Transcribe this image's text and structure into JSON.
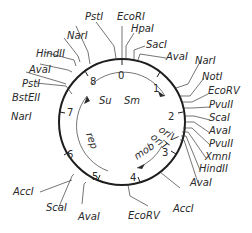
{
  "diagram": {
    "type": "plasmid-map",
    "scale_ticks": [
      "0",
      "1",
      "2",
      "3",
      "4",
      "5",
      "6",
      "7",
      "8"
    ],
    "genes": [
      {
        "label": "Su",
        "direction": "clockwise"
      },
      {
        "label": "Sm",
        "direction": "clockwise"
      },
      {
        "label": "rep",
        "direction": "clockwise"
      },
      {
        "label": "mob",
        "direction": "counterclockwise"
      },
      {
        "label": "oriV"
      },
      {
        "label": "oriT"
      }
    ],
    "restriction_sites": {
      "top": [
        "PstI",
        "EcoRI",
        "HpaI",
        "SacI",
        "AvaI"
      ],
      "right": [
        "NarI",
        "NotI",
        "EcoRV",
        "PvuII",
        "ScaI",
        "AvaI",
        "PvuII",
        "XmnI",
        "HindII",
        "AvaI"
      ],
      "bottom": [
        "AccI",
        "EcoRV",
        "AvaI",
        "ScaI",
        "AccI"
      ],
      "left": [
        "NarI",
        "BstEII",
        "PstI",
        "AvaI",
        "HindII",
        "NarI"
      ]
    }
  },
  "labels": {
    "pst1_top": "PstI",
    "ecori": "EcoRI",
    "hpai": "HpaI",
    "saci": "SacI",
    "avai_top": "AvaI",
    "nari_right": "NarI",
    "noti": "NotI",
    "ecorv_right": "EcoRV",
    "pvuii_1": "PvuII",
    "scai_right": "ScaI",
    "avai_right": "AvaI",
    "pvuii_2": "PvuII",
    "xmni": "XmnI",
    "hindii_right": "HindII",
    "avai_right2": "AvaI",
    "acci_right": "AccI",
    "ecorv_bottom": "EcoRV",
    "avai_bottom": "AvaI",
    "scai_left": "ScaI",
    "acci_left": "AccI",
    "nari_left": "NarI",
    "bsteii": "BstEII",
    "psti_left": "PstI",
    "avai_left": "AvaI",
    "hindii_left": "HindII",
    "nari_top": "NarI",
    "t0": "0",
    "t1": "1",
    "t2": "2",
    "t3": "3",
    "t4": "4",
    "t5": "5",
    "t6": "6",
    "t7": "7",
    "t8": "8",
    "su": "Su",
    "sm": "Sm",
    "rep": "rep",
    "mob": "mob",
    "oriv": "oriV",
    "orit": "oriT"
  }
}
